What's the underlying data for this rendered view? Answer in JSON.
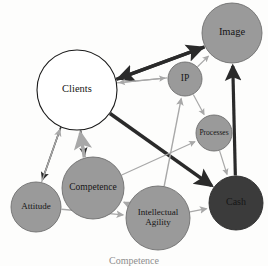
{
  "figure": {
    "caption": "Competence",
    "background_color": "#fdfdfc"
  },
  "palette": {
    "node_white_fill": "#ffffff",
    "node_white_stroke": "#1a1a1a",
    "node_gray_fill": "#9a9a9a",
    "node_gray_stroke": "#6f6f6f",
    "node_dark_fill": "#3b3b3b",
    "node_dark_stroke": "#2a2a2a",
    "arrow_dark": "#2b2b2b",
    "arrow_light": "#a8a8a8",
    "label_dark": "#161616",
    "label_light": "#efefef"
  },
  "nodes": [
    {
      "id": "image",
      "label": "Image",
      "cx": 232,
      "cy": 33,
      "r": 30,
      "fill_key": "node_gray_fill",
      "stroke_key": "node_gray_stroke",
      "text_color_key": "label_dark",
      "font_size": 10.5,
      "lines": [
        "Image"
      ]
    },
    {
      "id": "clients",
      "label": "Clients",
      "cx": 77,
      "cy": 90,
      "r": 40,
      "fill_key": "node_white_fill",
      "stroke_key": "node_white_stroke",
      "text_color_key": "label_dark",
      "font_size": 10.5,
      "lines": [
        "Clients"
      ]
    },
    {
      "id": "ip",
      "label": "IP",
      "cx": 185,
      "cy": 79,
      "r": 17,
      "fill_key": "node_gray_fill",
      "stroke_key": "node_gray_stroke",
      "text_color_key": "label_dark",
      "font_size": 9.5,
      "lines": [
        "IP"
      ]
    },
    {
      "id": "processes",
      "label": "Processes",
      "cx": 214,
      "cy": 133,
      "r": 18,
      "fill_key": "node_gray_fill",
      "stroke_key": "node_gray_stroke",
      "text_color_key": "label_dark",
      "font_size": 7.5,
      "lines": [
        "Processes"
      ]
    },
    {
      "id": "cash",
      "label": "Cash",
      "cx": 236,
      "cy": 203,
      "r": 27,
      "fill_key": "node_dark_fill",
      "stroke_key": "node_dark_stroke",
      "text_color_key": "label_light",
      "font_size": 10,
      "lines": [
        "Cash"
      ]
    },
    {
      "id": "attitude",
      "label": "Attitude",
      "cx": 36,
      "cy": 207,
      "r": 25,
      "fill_key": "node_gray_fill",
      "stroke_key": "node_gray_stroke",
      "text_color_key": "label_dark",
      "font_size": 9,
      "lines": [
        "Attitude"
      ]
    },
    {
      "id": "competence",
      "label": "Competence",
      "cx": 93,
      "cy": 188,
      "r": 31,
      "fill_key": "node_gray_fill",
      "stroke_key": "node_gray_stroke",
      "text_color_key": "label_dark",
      "font_size": 9.5,
      "lines": [
        "Competence"
      ]
    },
    {
      "id": "intellectual_agility",
      "label": "Intellectual Agility",
      "cx": 158,
      "cy": 218,
      "r": 32,
      "fill_key": "node_gray_fill",
      "stroke_key": "node_gray_stroke",
      "text_color_key": "label_dark",
      "font_size": 9,
      "lines": [
        "Intellectual",
        "Agility"
      ]
    }
  ],
  "edges": [
    {
      "id": "clients-to-image",
      "from": "clients",
      "to": "image",
      "style": "dark",
      "weight": 3.4,
      "label": "Clients to Image"
    },
    {
      "id": "image-to-clients",
      "from": "image",
      "to": "clients",
      "style": "dark",
      "weight": 3.4,
      "label": "Image to Clients"
    },
    {
      "id": "ip-to-image",
      "from": "ip",
      "to": "image",
      "style": "light",
      "weight": 1.2,
      "label": "IP to Image"
    },
    {
      "id": "ip-to-clients",
      "from": "ip",
      "to": "clients",
      "style": "light",
      "weight": 1.2,
      "label": "IP to Clients"
    },
    {
      "id": "ip-to-processes",
      "from": "ip",
      "to": "processes",
      "style": "light",
      "weight": 1.2,
      "label": "IP to Processes"
    },
    {
      "id": "clients-to-ip",
      "from": "clients",
      "to": "ip",
      "style": "light",
      "weight": 1.2,
      "label": "Clients to IP"
    },
    {
      "id": "clients-to-cash",
      "from": "clients",
      "to": "cash",
      "style": "dark",
      "weight": 3.6,
      "label": "Clients to Cash"
    },
    {
      "id": "cash-to-image",
      "from": "cash",
      "to": "image",
      "style": "dark",
      "weight": 3.2,
      "label": "Cash to Image"
    },
    {
      "id": "processes-to-cash",
      "from": "processes",
      "to": "cash",
      "style": "light",
      "weight": 1.2,
      "label": "Processes to Cash"
    },
    {
      "id": "clients-to-attitude",
      "from": "clients",
      "to": "attitude",
      "style": "dark",
      "weight": 1.6,
      "label": "Clients to Attitude"
    },
    {
      "id": "attitude-to-clients",
      "from": "attitude",
      "to": "clients",
      "style": "light",
      "weight": 1.4,
      "label": "Attitude to Clients"
    },
    {
      "id": "clients-to-competence",
      "from": "clients",
      "to": "competence",
      "style": "dark",
      "weight": 1.6,
      "label": "Clients to Competence"
    },
    {
      "id": "competence-to-clients",
      "from": "competence",
      "to": "clients",
      "style": "light",
      "weight": 3.4,
      "label": "Competence to Clients"
    },
    {
      "id": "attitude-to-agility",
      "from": "attitude",
      "to": "intellectual_agility",
      "style": "light",
      "weight": 1.4,
      "label": "Attitude to Intellectual Agility"
    },
    {
      "id": "agility-to-competence",
      "from": "intellectual_agility",
      "to": "competence",
      "style": "light",
      "weight": 1.4,
      "label": "Intellectual Agility to Competence"
    },
    {
      "id": "agility-to-cash",
      "from": "intellectual_agility",
      "to": "cash",
      "style": "light",
      "weight": 1.4,
      "label": "Intellectual Agility to Cash"
    },
    {
      "id": "agility-to-ip",
      "from": "intellectual_agility",
      "to": "ip",
      "style": "light",
      "weight": 1.4,
      "label": "Intellectual Agility to IP"
    },
    {
      "id": "competence-to-processes",
      "from": "competence",
      "to": "processes",
      "style": "light",
      "weight": 1.2,
      "label": "Competence to Processes"
    }
  ]
}
